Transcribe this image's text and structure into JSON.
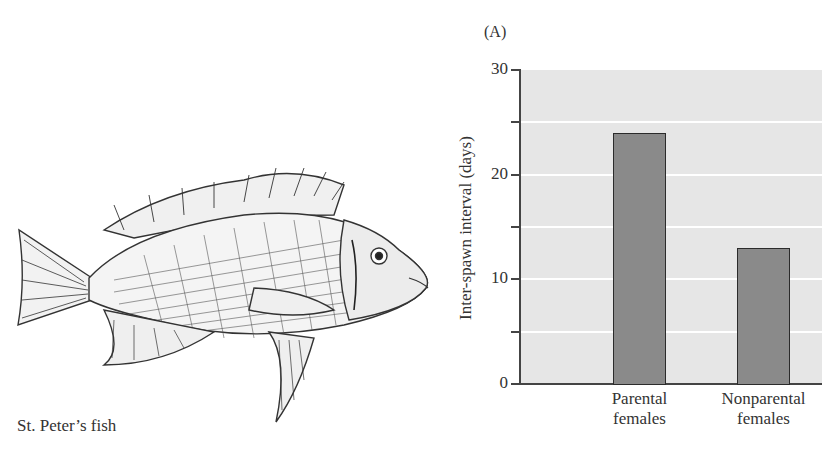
{
  "figure": {
    "panel_label": "(A)",
    "illustration_caption": "St. Peter’s fish"
  },
  "chart_data": {
    "type": "bar",
    "title": "",
    "panel": "(A)",
    "categories": [
      "Parental females",
      "Nonparental females"
    ],
    "category_lines": [
      [
        "Parental",
        "females"
      ],
      [
        "Nonparental",
        "females"
      ]
    ],
    "values": [
      24,
      13
    ],
    "xlabel": "",
    "ylabel": "Inter-spawn interval (days)",
    "ylim": [
      0,
      30
    ],
    "yticks": [
      0,
      10,
      20,
      30
    ],
    "minor_yticks": [
      5,
      15,
      25
    ],
    "grid": true,
    "legend": null,
    "colors": {
      "bar": "#8a8a8a",
      "bar_edge": "#2b2b2b",
      "plot_bg": "#e6e6e6",
      "gridline": "#ffffff"
    }
  }
}
